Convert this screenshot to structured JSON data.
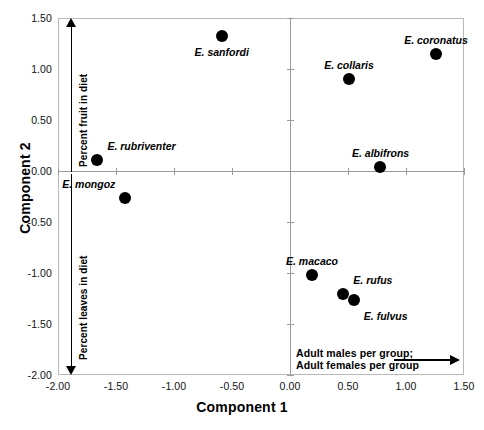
{
  "chart_data": {
    "type": "scatter",
    "title": "",
    "xlabel": "Component 1",
    "ylabel": "Component 2",
    "xlim": [
      -2.0,
      1.5
    ],
    "ylim": [
      -2.0,
      1.5
    ],
    "xticks": [
      "-2.00",
      "-1.50",
      "-1.00",
      "-0.50",
      "0.00",
      "0.50",
      "1.00",
      "1.50"
    ],
    "xtick_values": [
      -2.0,
      -1.5,
      -1.0,
      -0.5,
      0.0,
      0.5,
      1.0,
      1.5
    ],
    "yticks": [
      "1.50",
      "1.00",
      "0.50",
      "0.00",
      "-0.50",
      "-1.00",
      "-1.50",
      "-2.00"
    ],
    "ytick_values": [
      1.5,
      1.0,
      0.5,
      0.0,
      -0.5,
      -1.0,
      -1.5,
      -2.0
    ],
    "grid": false,
    "legend": "none",
    "marker_color": "#000000",
    "points": [
      {
        "label": "E. sanfordi",
        "x": -0.59,
        "y": 1.32,
        "label_pos": "below"
      },
      {
        "label": "E. coronatus",
        "x": 1.26,
        "y": 1.15,
        "label_pos": "above"
      },
      {
        "label": "E. collaris",
        "x": 0.51,
        "y": 0.9,
        "label_pos": "above"
      },
      {
        "label": "E. albifrons",
        "x": 0.78,
        "y": 0.04,
        "label_pos": "above"
      },
      {
        "label": "E. rubriventer",
        "x": -1.66,
        "y": 0.11,
        "label_pos": "above-right"
      },
      {
        "label": "E. mongoz",
        "x": -1.42,
        "y": -0.26,
        "label_pos": "above-left"
      },
      {
        "label": "E. macaco",
        "x": 0.19,
        "y": -1.02,
        "label_pos": "above"
      },
      {
        "label": "E. rufus",
        "x": 0.46,
        "y": -1.21,
        "label_pos": "above-right"
      },
      {
        "label": "E. fulvus",
        "x": 0.55,
        "y": -1.26,
        "label_pos": "below-right"
      }
    ],
    "annotations": [
      {
        "name": "percent-fruit",
        "text": "Percent fruit in diet",
        "direction": "up"
      },
      {
        "name": "percent-leaves",
        "text": "Percent leaves in diet",
        "direction": "down"
      },
      {
        "name": "group-composition",
        "text_line1": "Adult males per group;",
        "text_line2": "Adult females per group",
        "direction": "right"
      }
    ]
  }
}
